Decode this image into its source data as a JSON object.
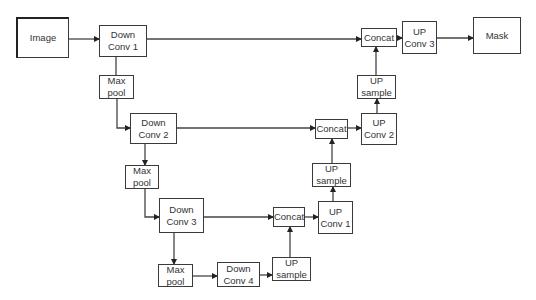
{
  "diagram": {
    "nodes": [
      {
        "id": "image",
        "lines": [
          "Image"
        ],
        "x": 16,
        "y": 17,
        "w": 53,
        "h": 41
      },
      {
        "id": "down_conv_1",
        "lines": [
          "Down",
          "Conv 1"
        ],
        "x": 99,
        "y": 25,
        "w": 48,
        "h": 32
      },
      {
        "id": "max_pool_1",
        "lines": [
          "Max",
          "pool"
        ],
        "x": 99,
        "y": 75,
        "w": 35,
        "h": 24
      },
      {
        "id": "down_conv_2",
        "lines": [
          "Down",
          "Conv 2"
        ],
        "x": 130,
        "y": 113,
        "w": 47,
        "h": 31
      },
      {
        "id": "max_pool_2",
        "lines": [
          "Max",
          "pool"
        ],
        "x": 125,
        "y": 165,
        "w": 34,
        "h": 24
      },
      {
        "id": "down_conv_3",
        "lines": [
          "Down",
          "Conv 3"
        ],
        "x": 159,
        "y": 198,
        "w": 45,
        "h": 35
      },
      {
        "id": "max_pool_3",
        "lines": [
          "Max",
          "pool"
        ],
        "x": 158,
        "y": 264,
        "w": 35,
        "h": 23
      },
      {
        "id": "down_conv_4",
        "lines": [
          "Down",
          "Conv 4"
        ],
        "x": 217,
        "y": 262,
        "w": 43,
        "h": 25
      },
      {
        "id": "up_sample_1",
        "lines": [
          "UP",
          "sample"
        ],
        "x": 272,
        "y": 257,
        "w": 39,
        "h": 24
      },
      {
        "id": "concat_1",
        "lines": [
          "Concat"
        ],
        "x": 273,
        "y": 207,
        "w": 32,
        "h": 20
      },
      {
        "id": "up_conv_1",
        "lines": [
          "UP",
          "Conv 1"
        ],
        "x": 318,
        "y": 201,
        "w": 35,
        "h": 33
      },
      {
        "id": "up_sample_2",
        "lines": [
          "UP",
          "sample"
        ],
        "x": 312,
        "y": 163,
        "w": 39,
        "h": 24
      },
      {
        "id": "concat_2",
        "lines": [
          "Concat"
        ],
        "x": 315,
        "y": 119,
        "w": 33,
        "h": 20
      },
      {
        "id": "up_conv_2",
        "lines": [
          "UP",
          "Conv 2"
        ],
        "x": 361,
        "y": 113,
        "w": 36,
        "h": 32
      },
      {
        "id": "up_sample_3",
        "lines": [
          "UP",
          "sample"
        ],
        "x": 357,
        "y": 75,
        "w": 39,
        "h": 24
      },
      {
        "id": "concat_3",
        "lines": [
          "Concat"
        ],
        "x": 361,
        "y": 28,
        "w": 36,
        "h": 19
      },
      {
        "id": "up_conv_3",
        "lines": [
          "UP",
          "Conv 3"
        ],
        "x": 402,
        "y": 21,
        "w": 35,
        "h": 33
      },
      {
        "id": "mask",
        "lines": [
          "Mask"
        ],
        "x": 473,
        "y": 17,
        "w": 48,
        "h": 37
      }
    ],
    "edges": [
      {
        "from": "image",
        "to": "down_conv_1",
        "points": [
          [
            69,
            39
          ],
          [
            99,
            39
          ]
        ],
        "arrow": true
      },
      {
        "from": "down_conv_1",
        "to": "concat_3",
        "points": [
          [
            147,
            39
          ],
          [
            361,
            39
          ]
        ],
        "arrow": true
      },
      {
        "from": "down_conv_1",
        "to": "max_pool_1",
        "points": [
          [
            116,
            57
          ],
          [
            116,
            75
          ]
        ],
        "arrow": false
      },
      {
        "from": "max_pool_1",
        "to": "down_conv_2",
        "points": [
          [
            117,
            99
          ],
          [
            117,
            128
          ],
          [
            130,
            128
          ]
        ],
        "arrow": true
      },
      {
        "from": "down_conv_2",
        "to": "concat_2",
        "points": [
          [
            177,
            128
          ],
          [
            315,
            128
          ]
        ],
        "arrow": true
      },
      {
        "from": "down_conv_2",
        "to": "max_pool_2",
        "points": [
          [
            145,
            144
          ],
          [
            145,
            165
          ]
        ],
        "arrow": true
      },
      {
        "from": "max_pool_2",
        "to": "down_conv_3",
        "points": [
          [
            145,
            189
          ],
          [
            145,
            217
          ],
          [
            159,
            217
          ]
        ],
        "arrow": true
      },
      {
        "from": "down_conv_3",
        "to": "concat_1",
        "points": [
          [
            204,
            217
          ],
          [
            273,
            217
          ]
        ],
        "arrow": true
      },
      {
        "from": "down_conv_3",
        "to": "max_pool_3",
        "points": [
          [
            174,
            233
          ],
          [
            174,
            264
          ]
        ],
        "arrow": true
      },
      {
        "from": "max_pool_3",
        "to": "down_conv_4",
        "points": [
          [
            193,
            276
          ],
          [
            217,
            276
          ]
        ],
        "arrow": true
      },
      {
        "from": "down_conv_4",
        "to": "up_sample_1",
        "points": [
          [
            260,
            275
          ],
          [
            272,
            275
          ]
        ],
        "arrow": true
      },
      {
        "from": "up_sample_1",
        "to": "concat_1",
        "points": [
          [
            290,
            257
          ],
          [
            290,
            227
          ]
        ],
        "arrow": true
      },
      {
        "from": "concat_1",
        "to": "up_conv_1",
        "points": [
          [
            305,
            217
          ],
          [
            318,
            217
          ]
        ],
        "arrow": true
      },
      {
        "from": "up_conv_1",
        "to": "up_sample_2",
        "points": [
          [
            333,
            201
          ],
          [
            333,
            187
          ]
        ],
        "arrow": true
      },
      {
        "from": "up_sample_2",
        "to": "concat_2",
        "points": [
          [
            332,
            163
          ],
          [
            332,
            139
          ]
        ],
        "arrow": true
      },
      {
        "from": "concat_2",
        "to": "up_conv_2",
        "points": [
          [
            348,
            128
          ],
          [
            361,
            128
          ]
        ],
        "arrow": true
      },
      {
        "from": "up_conv_2",
        "to": "up_sample_3",
        "points": [
          [
            377,
            113
          ],
          [
            377,
            99
          ]
        ],
        "arrow": true
      },
      {
        "from": "up_sample_3",
        "to": "concat_3",
        "points": [
          [
            376,
            75
          ],
          [
            376,
            47
          ]
        ],
        "arrow": true
      },
      {
        "from": "concat_3",
        "to": "up_conv_3",
        "points": [
          [
            397,
            38
          ],
          [
            402,
            38
          ]
        ],
        "arrow": true
      },
      {
        "from": "up_conv_3",
        "to": "mask",
        "points": [
          [
            437,
            38
          ],
          [
            473,
            38
          ]
        ],
        "arrow": true
      }
    ]
  }
}
